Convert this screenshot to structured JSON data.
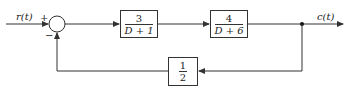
{
  "diagram": {
    "input_label": "r(t)",
    "output_label": "c(t)",
    "summing_junction": {
      "plus_sign": "+",
      "minus_sign": "−"
    },
    "forward_blocks": [
      {
        "numerator": "3",
        "denominator": "D + 1"
      },
      {
        "numerator": "4",
        "denominator": "D + 6"
      }
    ],
    "feedback_block": {
      "numerator": "1",
      "denominator": "2"
    },
    "line_color": "#333333"
  }
}
